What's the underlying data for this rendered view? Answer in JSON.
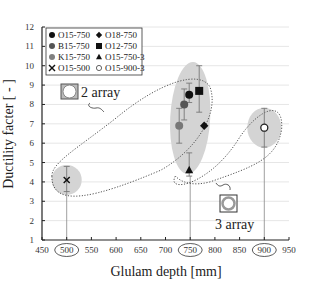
{
  "chart_data": {
    "type": "scatter",
    "title": "",
    "xlabel": "Glulam depth [mm]",
    "ylabel": "Ductility facter [ - ]",
    "xlim": [
      450,
      950
    ],
    "ylim": [
      1,
      12
    ],
    "x_ticks": [
      450,
      500,
      550,
      600,
      650,
      700,
      750,
      800,
      850,
      900,
      950
    ],
    "y_ticks": [
      1,
      2,
      3,
      4,
      5,
      6,
      7,
      8,
      9,
      10,
      11,
      12
    ],
    "circled_x_ticks": [
      500,
      750,
      900
    ],
    "grid": "horizontal",
    "legend_position": "upper-left",
    "series": [
      {
        "name": "O15-750",
        "marker": "circle",
        "color": "#111111",
        "x": 750,
        "y": 8.5,
        "err_low": 8.1,
        "err_high": 9.1
      },
      {
        "name": "B15-750",
        "marker": "circle",
        "color": "#555555",
        "x": 750,
        "y": 8.0,
        "err_low": 7.2,
        "err_high": 8.8
      },
      {
        "name": "K15-750",
        "marker": "circle",
        "color": "#777777",
        "x": 750,
        "y": 6.9,
        "err_low": 6.0,
        "err_high": 7.8
      },
      {
        "name": "O15-500",
        "marker": "x",
        "color": "#111111",
        "x": 500,
        "y": 4.1,
        "err_low": 3.5,
        "err_high": 4.8
      },
      {
        "name": "O18-750",
        "marker": "diamond",
        "color": "#111111",
        "x": 750,
        "y": 6.9,
        "err_low": 6.9,
        "err_high": 6.9
      },
      {
        "name": "O12-750",
        "marker": "square",
        "color": "#111111",
        "x": 750,
        "y": 8.7,
        "err_low": 7.6,
        "err_high": 10.0
      },
      {
        "name": "O15-750-3",
        "marker": "triangle",
        "color": "#111111",
        "x": 750,
        "y": 4.6,
        "err_low": 4.3,
        "err_high": 5.5
      },
      {
        "name": "O15-900-3",
        "marker": "open-circle",
        "color": "#ffffff",
        "x": 900,
        "y": 6.8,
        "err_low": 5.8,
        "err_high": 7.8
      }
    ],
    "annotations": [
      {
        "text": "2 array",
        "type": "dotted-loop",
        "encloses": [
          "O15-500",
          "O15-750",
          "B15-750",
          "K15-750",
          "O12-750",
          "O18-750"
        ]
      },
      {
        "text": "3 array",
        "type": "dotted-loop",
        "encloses": [
          "O15-750-3",
          "O15-900-3"
        ]
      }
    ]
  },
  "axis": {
    "xlabel": "Glulam depth [mm]",
    "ylabel": "Ductility facter [ - ]"
  },
  "legend": {
    "items": [
      {
        "label": "O15-750",
        "marker": "circle-black"
      },
      {
        "label": "B15-750",
        "marker": "circle-darkgray"
      },
      {
        "label": "K15-750",
        "marker": "circle-gray"
      },
      {
        "label": "O15-500",
        "marker": "x"
      },
      {
        "label": "O18-750",
        "marker": "diamond"
      },
      {
        "label": "O12-750",
        "marker": "square"
      },
      {
        "label": "O15-750-3",
        "marker": "triangle"
      },
      {
        "label": "O15-900-3",
        "marker": "open-circle"
      }
    ]
  },
  "annotations": {
    "two_array": "2 array",
    "three_array": "3 array"
  }
}
